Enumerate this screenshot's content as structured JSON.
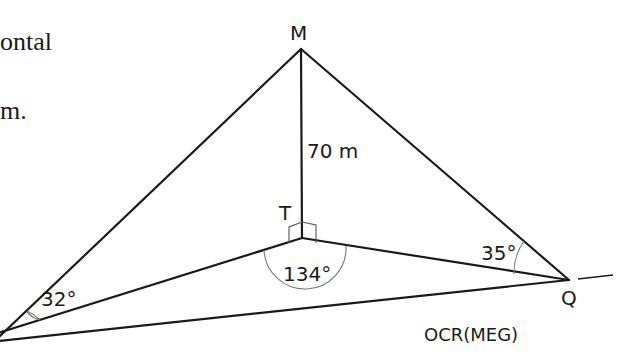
{
  "text_fragments": {
    "line1": "ontal",
    "line2": "m."
  },
  "diagram": {
    "points": {
      "M": {
        "label": "M"
      },
      "T": {
        "label": "T"
      },
      "Q": {
        "label": "Q"
      }
    },
    "lengths": {
      "MT": "70 m"
    },
    "angles": {
      "P": "32°",
      "T": "134°",
      "Q": "35°"
    },
    "right_angle_marks": [
      "MTP",
      "MTQ"
    ],
    "source": "OCR(MEG)"
  }
}
